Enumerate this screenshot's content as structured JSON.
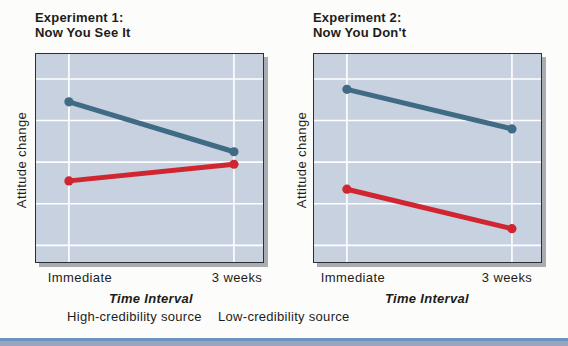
{
  "figure": {
    "ylabel": "Attitude change",
    "xlabel": "Time Interval",
    "plot_background": "#c7d1e0",
    "gridline_color": "#ffffff"
  },
  "legend": {
    "items": [
      {
        "label": "High-credibility source",
        "color": "#3f6b84"
      },
      {
        "label": "Low-credibility source",
        "color": "#cf2630"
      }
    ]
  },
  "chart_data": [
    {
      "type": "line",
      "title_line1": "Experiment 1:",
      "title_line2": "Now You See It",
      "xlabel": "Time Interval",
      "ylabel": "Attitude change",
      "categories": [
        "Immediate",
        "3 weeks"
      ],
      "series": [
        {
          "name": "High-credibility source",
          "color": "#3f6b84",
          "values": [
            0.77,
            0.53
          ]
        },
        {
          "name": "Low-credibility source",
          "color": "#cf2630",
          "values": [
            0.39,
            0.47
          ]
        }
      ],
      "ylim": [
        0,
        1
      ],
      "value_note": "relative attitude change; y axis unlabeled in source",
      "layout": {
        "grid": true,
        "v_grid_fractions": [
          0.145,
          0.872
        ],
        "h_grid_fractions": [
          0.12,
          0.32,
          0.52,
          0.72,
          0.92
        ]
      }
    },
    {
      "type": "line",
      "title_line1": "Experiment 2:",
      "title_line2": "Now You Don't",
      "xlabel": "Time Interval",
      "ylabel": "Attitude change",
      "categories": [
        "Immediate",
        "3 weeks"
      ],
      "series": [
        {
          "name": "High-credibility source",
          "color": "#3f6b84",
          "values": [
            0.83,
            0.64
          ]
        },
        {
          "name": "Low-credibility source",
          "color": "#cf2630",
          "values": [
            0.35,
            0.16
          ]
        }
      ],
      "ylim": [
        0,
        1
      ],
      "value_note": "relative attitude change; y axis unlabeled in source",
      "layout": {
        "grid": true,
        "v_grid_fractions": [
          0.145,
          0.872
        ],
        "h_grid_fractions": [
          0.12,
          0.32,
          0.52,
          0.72,
          0.92
        ]
      }
    }
  ]
}
